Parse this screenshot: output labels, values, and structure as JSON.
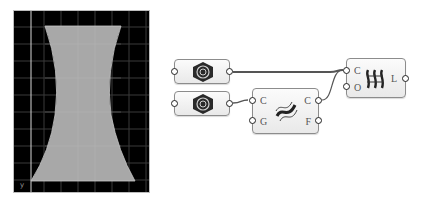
{
  "viewport": {
    "background": "#000000",
    "grid_color": "#3a3a3a",
    "shape_color": "#a8a8a8",
    "axis_label": "y",
    "shape": "hyperbolic-profile surface"
  },
  "nodes": [
    {
      "id": "curve_param_1",
      "icon": "curve-param-icon",
      "inputs": [],
      "outputs": []
    },
    {
      "id": "curve_param_2",
      "icon": "curve-param-icon",
      "inputs": [],
      "outputs": []
    },
    {
      "id": "offset_component",
      "icon": "offset-curve-icon",
      "inputs": [
        "C",
        "G"
      ],
      "outputs": [
        "C",
        "F"
      ]
    },
    {
      "id": "loft_component",
      "icon": "loft-icon",
      "inputs": [
        "C",
        "O"
      ],
      "outputs": [
        "L"
      ]
    }
  ],
  "wire_color": "#555555"
}
